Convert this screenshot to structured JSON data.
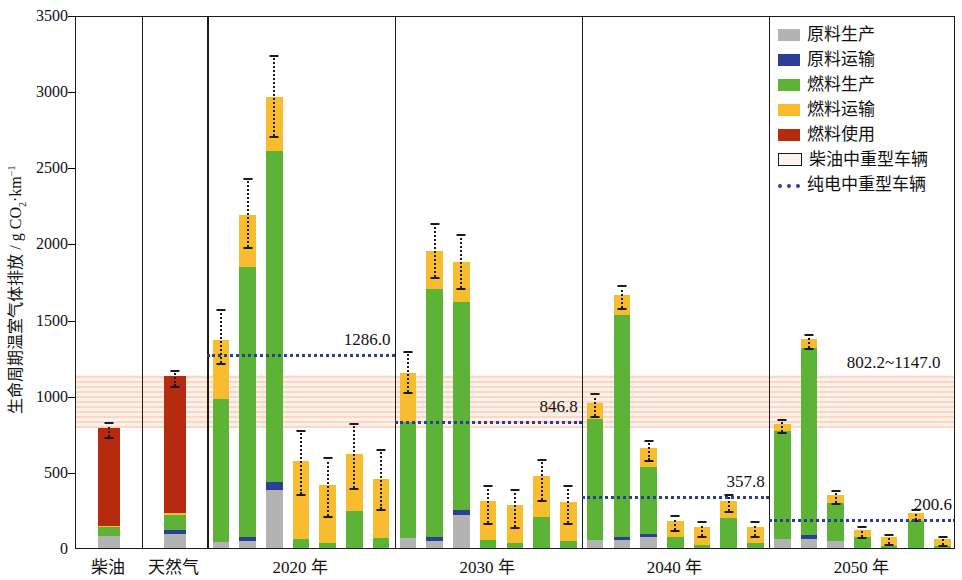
{
  "chart_data": {
    "type": "bar",
    "title": "",
    "xlabel": "",
    "ylabel": "生命周期温室气体排放 / g CO₂·km⁻¹",
    "ylim": [
      0,
      3500
    ],
    "ytick_values": [
      0,
      500,
      1000,
      1500,
      2000,
      2500,
      3000,
      3500
    ],
    "ytick_labels": [
      "0",
      "500",
      "1000",
      "1500",
      "2000",
      "2500",
      "3000",
      "3500"
    ],
    "grid": false,
    "legend_position": "top-right",
    "stack_order": [
      "原料生产",
      "原料运输",
      "燃料生产",
      "燃料运输",
      "燃料使用"
    ],
    "stack_colors": [
      "#b3b3b3",
      "#2a3f95",
      "#5cb335",
      "#f7bd2e",
      "#b62b10"
    ],
    "groups": [
      {
        "name": "柴油",
        "bars": [
          {
            "segments": [
              80,
              0,
              55,
              10,
              645
            ],
            "total": 790,
            "err_low": 740,
            "err_high": 840
          }
        ]
      },
      {
        "name": "天然气",
        "bars": [
          {
            "segments": [
              95,
              25,
              95,
              15,
              900
            ],
            "total": 1130,
            "err_low": 1080,
            "err_high": 1180
          }
        ]
      },
      {
        "name": "2020 年",
        "bars": [
          {
            "segments": [
              40,
              0,
              940,
              385,
              0
            ],
            "total": 1365,
            "err_low": 1230,
            "err_high": 1580
          },
          {
            "segments": [
              45,
              25,
              1775,
              345,
              0
            ],
            "total": 2190,
            "err_low": 1990,
            "err_high": 2440
          },
          {
            "segments": [
              380,
              55,
              2175,
              355,
              0
            ],
            "total": 2965,
            "err_low": 2720,
            "err_high": 3250
          },
          {
            "segments": [
              0,
              0,
              60,
              510,
              0
            ],
            "total": 570,
            "err_low": 365,
            "err_high": 790
          },
          {
            "segments": [
              0,
              0,
              35,
              380,
              0
            ],
            "total": 415,
            "err_low": 225,
            "err_high": 610
          },
          {
            "segments": [
              0,
              0,
              240,
              380,
              0
            ],
            "total": 620,
            "err_low": 410,
            "err_high": 835
          },
          {
            "segments": [
              0,
              0,
              65,
              390,
              0
            ],
            "total": 455,
            "err_low": 270,
            "err_high": 660
          }
        ]
      },
      {
        "name": "2030 年",
        "bars": [
          {
            "segments": [
              65,
              0,
              760,
              325,
              0
            ],
            "total": 1150,
            "err_low": 1035,
            "err_high": 1305
          },
          {
            "segments": [
              45,
              25,
              1630,
              250,
              0
            ],
            "total": 1950,
            "err_low": 1790,
            "err_high": 2150
          },
          {
            "segments": [
              215,
              35,
              1365,
              265,
              0
            ],
            "total": 1880,
            "err_low": 1720,
            "err_high": 2075
          },
          {
            "segments": [
              0,
              0,
              50,
              260,
              0
            ],
            "total": 310,
            "err_low": 180,
            "err_high": 430
          },
          {
            "segments": [
              0,
              0,
              30,
              250,
              0
            ],
            "total": 280,
            "err_low": 150,
            "err_high": 400
          },
          {
            "segments": [
              0,
              0,
              205,
              270,
              0
            ],
            "total": 475,
            "err_low": 330,
            "err_high": 600
          },
          {
            "segments": [
              0,
              0,
              45,
              260,
              0
            ],
            "total": 305,
            "err_low": 175,
            "err_high": 425
          }
        ]
      },
      {
        "name": "2040 年",
        "bars": [
          {
            "segments": [
              55,
              0,
              790,
              110,
              0
            ],
            "total": 955,
            "err_low": 880,
            "err_high": 1030
          },
          {
            "segments": [
              50,
              25,
              1455,
              130,
              0
            ],
            "total": 1660,
            "err_low": 1590,
            "err_high": 1740
          },
          {
            "segments": [
              75,
              20,
              435,
              125,
              0
            ],
            "total": 655,
            "err_low": 590,
            "err_high": 720
          },
          {
            "segments": [
              0,
              0,
              75,
              105,
              0
            ],
            "total": 180,
            "err_low": 130,
            "err_high": 230
          },
          {
            "segments": [
              0,
              0,
              20,
              120,
              0
            ],
            "total": 140,
            "err_low": 95,
            "err_high": 190
          },
          {
            "segments": [
              0,
              0,
              200,
              110,
              0
            ],
            "total": 310,
            "err_low": 255,
            "err_high": 365
          },
          {
            "segments": [
              0,
              0,
              30,
              110,
              0
            ],
            "total": 140,
            "err_low": 95,
            "err_high": 190
          }
        ]
      },
      {
        "name": "2050 年",
        "bars": [
          {
            "segments": [
              60,
              0,
              710,
              45,
              0
            ],
            "total": 815,
            "err_low": 775,
            "err_high": 860
          },
          {
            "segments": [
              60,
              25,
              1230,
              55,
              0
            ],
            "total": 1370,
            "err_low": 1325,
            "err_high": 1420
          },
          {
            "segments": [
              45,
              0,
              250,
              55,
              0
            ],
            "total": 350,
            "err_low": 310,
            "err_high": 395
          },
          {
            "segments": [
              0,
              0,
              75,
              45,
              0
            ],
            "total": 120,
            "err_low": 85,
            "err_high": 160
          },
          {
            "segments": [
              0,
              0,
              15,
              55,
              0
            ],
            "total": 70,
            "err_low": 40,
            "err_high": 105
          },
          {
            "segments": [
              0,
              0,
              180,
              50,
              0
            ],
            "total": 230,
            "err_low": 195,
            "err_high": 270
          },
          {
            "segments": [
              0,
              0,
              15,
              45,
              0
            ],
            "total": 60,
            "err_low": 30,
            "err_high": 95
          }
        ]
      }
    ],
    "reference_lines": [
      {
        "label": "1286.0",
        "value": 1286.0,
        "group": "2020 年",
        "color": "#2b3f8c"
      },
      {
        "label": "846.8",
        "value": 846.8,
        "group": "2030 年",
        "color": "#2b3f8c"
      },
      {
        "label": "357.8",
        "value": 357.8,
        "group": "2040 年",
        "color": "#2b3f8c"
      },
      {
        "label": "200.6",
        "value": 200.6,
        "group": "2050 年",
        "color": "#2b3f8c"
      }
    ],
    "band": {
      "label": "802.2~1147.0",
      "low": 802.2,
      "high": 1147.0,
      "color": "#f6d6c6"
    }
  },
  "legend": {
    "items": [
      {
        "label": "原料生产",
        "swatch": "solid",
        "color": "#b3b3b3"
      },
      {
        "label": "原料运输",
        "swatch": "solid",
        "color": "#2a3f95"
      },
      {
        "label": "燃料生产",
        "swatch": "solid",
        "color": "#5cb335"
      },
      {
        "label": "燃料运输",
        "swatch": "solid",
        "color": "#f7bd2e"
      },
      {
        "label": "燃料使用",
        "swatch": "solid",
        "color": "#b62b10"
      },
      {
        "label": "柴油中重型车辆",
        "swatch": "hollow",
        "color": "#fdf3ec"
      },
      {
        "label": "纯电中重型车辆",
        "swatch": "dotted",
        "color": "#2b3f8c"
      }
    ]
  },
  "axis": {
    "y_title_main": "生命周期温室气体排放 / g CO",
    "y_title_sub": "2",
    "y_title_tail": "·km",
    "y_title_sup": "−1"
  }
}
